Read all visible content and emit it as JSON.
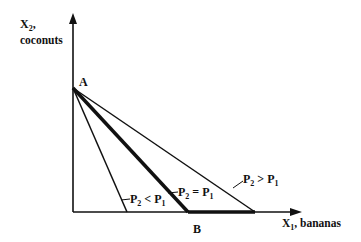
{
  "diagram": {
    "y_axis": {
      "symbol": "X",
      "subscript": "2",
      "suffix": ",",
      "label": "coconuts"
    },
    "x_axis": {
      "symbol": "X",
      "subscript": "1",
      "suffix": ", bananas"
    },
    "points": {
      "a": "A",
      "b": "B"
    },
    "lines": [
      {
        "name": "steep",
        "p_left": "P",
        "p_left_sub": "2",
        "op": " < ",
        "p_right": "P",
        "p_right_sub": "1"
      },
      {
        "name": "bold",
        "p_left": "P",
        "p_left_sub": "2",
        "op": " = ",
        "p_right": "P",
        "p_right_sub": "1"
      },
      {
        "name": "shallow",
        "p_left": "P",
        "p_left_sub": "2",
        "op": " > ",
        "p_right": "P",
        "p_right_sub": "1"
      }
    ],
    "colors": {
      "ink": "#111111",
      "background": "#ffffff"
    }
  }
}
